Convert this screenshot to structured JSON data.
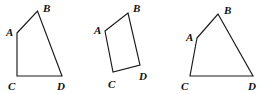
{
  "canvas": {
    "width": 272,
    "height": 94,
    "background_color": "#ffffff",
    "stroke_color": "#1a1a1a",
    "label_color": "#111111",
    "description": "Three hand-drawn style quadrilaterals labeled A, B, C, D"
  },
  "figures": [
    {
      "id": "figure-1",
      "name": "quadrilateral-left",
      "shape": "quadrilateral",
      "vertices": [
        {
          "label": "A",
          "x": 17,
          "y": 33
        },
        {
          "label": "B",
          "x": 37.5,
          "y": 11
        },
        {
          "label": "D",
          "x": 62,
          "y": 76
        },
        {
          "label": "C",
          "x": 17,
          "y": 76
        }
      ],
      "labels": [
        {
          "text": "A",
          "x": 6,
          "y": 36
        },
        {
          "text": "B",
          "x": 43,
          "y": 12
        },
        {
          "text": "C",
          "x": 8,
          "y": 90
        },
        {
          "text": "D",
          "x": 57,
          "y": 90
        }
      ]
    },
    {
      "id": "figure-2",
      "name": "quadrilateral-middle",
      "shape": "quadrilateral",
      "vertices": [
        {
          "label": "A",
          "x": 105,
          "y": 31
        },
        {
          "label": "B",
          "x": 128,
          "y": 13
        },
        {
          "label": "D",
          "x": 140,
          "y": 65
        },
        {
          "label": "C",
          "x": 113,
          "y": 72
        }
      ],
      "labels": [
        {
          "text": "A",
          "x": 94,
          "y": 34
        },
        {
          "text": "B",
          "x": 133,
          "y": 12
        },
        {
          "text": "C",
          "x": 108,
          "y": 88
        },
        {
          "text": "D",
          "x": 139,
          "y": 80
        }
      ]
    },
    {
      "id": "figure-3",
      "name": "quadrilateral-right",
      "shape": "quadrilateral",
      "vertices": [
        {
          "label": "A",
          "x": 197,
          "y": 38
        },
        {
          "label": "B",
          "x": 218,
          "y": 14
        },
        {
          "label": "D",
          "x": 253,
          "y": 76
        },
        {
          "label": "C",
          "x": 190,
          "y": 76
        }
      ],
      "labels": [
        {
          "text": "A",
          "x": 186,
          "y": 41
        },
        {
          "text": "B",
          "x": 224,
          "y": 14
        },
        {
          "text": "C",
          "x": 181,
          "y": 90
        },
        {
          "text": "D",
          "x": 248,
          "y": 90
        }
      ]
    }
  ]
}
